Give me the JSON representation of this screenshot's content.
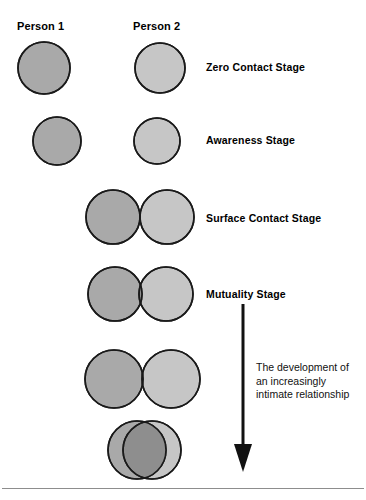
{
  "headers": {
    "person_1": "Person 1",
    "person_2": "Person 2"
  },
  "colors": {
    "person_1_fill": "#a9a9a9",
    "person_2_fill": "#c6c6c6",
    "overlap_fill": "#8e8e8e",
    "outline": "#1a1a1a",
    "text": "#000000",
    "rule": "#8d8d8d",
    "background": "#ffffff"
  },
  "stages": [
    {
      "id": "zero-contact",
      "label": "Zero Contact Stage",
      "label_x": 206,
      "label_y": 61,
      "overlap": "none",
      "cy": 68,
      "r1": 26,
      "r2": 25,
      "cx1": 44,
      "cx2": 160
    },
    {
      "id": "awareness",
      "label": "Awareness Stage",
      "label_x": 206,
      "label_y": 134,
      "overlap": "none",
      "cy": 141,
      "r1": 24,
      "r2": 23,
      "cx1": 57,
      "cx2": 157
    },
    {
      "id": "surface-contact",
      "label": "Surface Contact Stage",
      "label_x": 206,
      "label_y": 212,
      "overlap": "tangent",
      "cy": 217,
      "r1": 27,
      "r2": 27,
      "cx1": 113,
      "cx2": 167
    },
    {
      "id": "mutuality",
      "label": "Mutuality Stage",
      "label_x": 206,
      "label_y": 288,
      "overlap": "slight",
      "cy": 294,
      "r1": 27,
      "r2": 27,
      "cx1": 115,
      "cx2": 166
    },
    {
      "id": "deepening",
      "label": "",
      "overlap": "moderate",
      "cy": 379,
      "r1": 29,
      "r2": 29,
      "cx1": 114,
      "cx2": 171
    },
    {
      "id": "intimate",
      "label": "",
      "overlap": "near-total",
      "cy": 450,
      "r1": 29,
      "r2": 29,
      "cx1": 137,
      "cx2": 152
    }
  ],
  "arrow": {
    "name": "development-arrow",
    "direction": "down",
    "caption_lines": [
      "The development of",
      "an increasingly",
      "intimate relationship"
    ]
  }
}
